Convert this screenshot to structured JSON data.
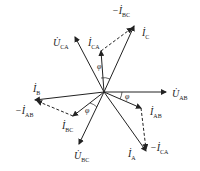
{
  "diagram": {
    "type": "phasor-diagram",
    "origin": [
      104,
      92
    ],
    "phasors": [
      {
        "id": "U_AB",
        "label": "U",
        "sub": "AB",
        "end": [
          166,
          92
        ],
        "style": "solid"
      },
      {
        "id": "U_CA",
        "label": "U",
        "sub": "CA",
        "end": [
          75,
          37
        ],
        "style": "solid"
      },
      {
        "id": "U_BC",
        "label": "U",
        "sub": "BC",
        "end": [
          79,
          144
        ],
        "style": "solid"
      },
      {
        "id": "I_C",
        "label": "I",
        "sub": "C",
        "end": [
          134,
          26
        ],
        "style": "solid"
      },
      {
        "id": "I_CA",
        "label": "I",
        "sub": "CA",
        "end": [
          101,
          51
        ],
        "style": "solid"
      },
      {
        "id": "I_B",
        "label": "I",
        "sub": "B",
        "end": [
          35,
          100
        ],
        "style": "solid"
      },
      {
        "id": "I_BC",
        "label": "I",
        "sub": "BC",
        "end": [
          73,
          116
        ],
        "style": "solid"
      },
      {
        "id": "I_AB",
        "label": "I",
        "sub": "AB",
        "end": [
          141,
          108
        ],
        "style": "solid"
      },
      {
        "id": "I_A",
        "label": "I",
        "sub": "A",
        "end": [
          146,
          151
        ],
        "style": "solid"
      },
      {
        "id": "neg_I_BC",
        "label": "-I",
        "sub": "BC",
        "from": [
          101,
          51
        ],
        "end": [
          134,
          26
        ],
        "style": "dashed"
      },
      {
        "id": "neg_I_AB",
        "label": "-I",
        "sub": "AB",
        "from": [
          73,
          116
        ],
        "end": [
          35,
          100
        ],
        "style": "dashed"
      },
      {
        "id": "neg_I_CA",
        "label": "-I",
        "sub": "CA",
        "from": [
          141,
          108
        ],
        "end": [
          146,
          151
        ],
        "style": "dashed"
      }
    ],
    "angle_label": "φ"
  },
  "labels": {
    "neg_I_BC": {
      "main": "−İ",
      "sub": "BC"
    },
    "I_C": {
      "main": "İ",
      "sub": "C"
    },
    "U_CA": {
      "main": "U̇",
      "sub": "CA"
    },
    "I_CA": {
      "main": "İ",
      "sub": "CA"
    },
    "I_B": {
      "main": "İ",
      "sub": "B"
    },
    "neg_I_AB": {
      "main": "−İ",
      "sub": "AB"
    },
    "I_BC": {
      "main": "İ",
      "sub": "BC"
    },
    "U_BC": {
      "main": "U̇",
      "sub": "BC"
    },
    "U_AB": {
      "main": "U̇",
      "sub": "AB"
    },
    "I_AB": {
      "main": "İ",
      "sub": "AB"
    },
    "I_A": {
      "main": "İ",
      "sub": "A"
    },
    "neg_I_CA": {
      "main": "−İ",
      "sub": "CA"
    },
    "phi": "φ"
  }
}
